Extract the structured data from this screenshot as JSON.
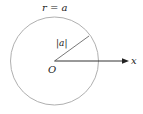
{
  "diagram": {
    "title_label": "r = a",
    "radius_label": "|a|",
    "origin_label": "O",
    "axis_label": "x",
    "colors": {
      "circle": "#b0b0b0",
      "radius_line": "#555555",
      "axis": "#333333",
      "text": "#222222"
    }
  }
}
